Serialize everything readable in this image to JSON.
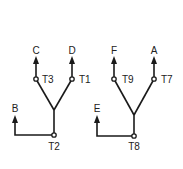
{
  "diagrams": [
    {
      "id": "left",
      "outputs": [
        {
          "label": "C",
          "terminal": "T3",
          "x": 36,
          "y_top": 58,
          "y_node": 79
        },
        {
          "label": "D",
          "terminal": "T1",
          "x": 72,
          "y_top": 58,
          "y_node": 79
        }
      ],
      "junction": {
        "x": 54,
        "y": 110
      },
      "base": {
        "terminal": "T2",
        "x": 54,
        "y": 135
      },
      "input": {
        "label": "B",
        "x": 15,
        "y_top": 117
      }
    },
    {
      "id": "right",
      "outputs": [
        {
          "label": "F",
          "terminal": "T9",
          "x": 114,
          "y_top": 58,
          "y_node": 79
        },
        {
          "label": "A",
          "terminal": "T7",
          "x": 154,
          "y_top": 58,
          "y_node": 79
        }
      ],
      "junction": {
        "x": 134,
        "y": 115
      },
      "base": {
        "terminal": "T8",
        "x": 134,
        "y": 136
      },
      "input": {
        "label": "E",
        "x": 97,
        "y_top": 117
      }
    }
  ],
  "labels": {
    "c": "C",
    "d": "D",
    "t3": "T3",
    "t1": "T1",
    "b": "B",
    "t2": "T2",
    "f": "F",
    "a": "A",
    "t9": "T9",
    "t7": "T7",
    "e": "E",
    "t8": "T8"
  }
}
